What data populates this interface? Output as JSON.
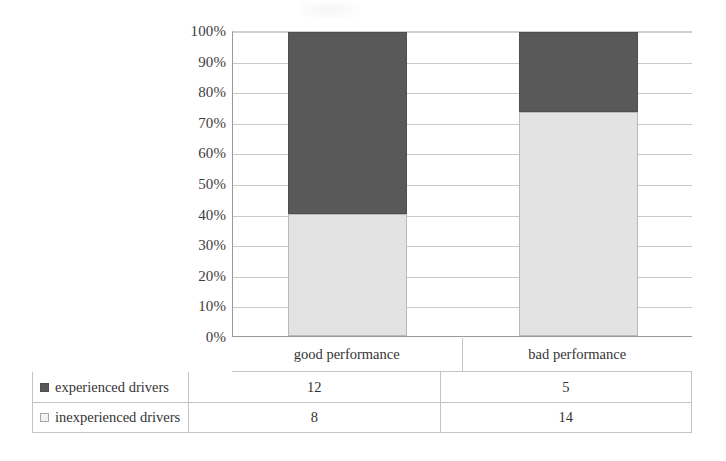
{
  "chart_data": {
    "type": "bar",
    "subtype": "stacked-100-percent",
    "title": "",
    "subtitle": "",
    "xlabel": "",
    "ylabel": "",
    "categories": [
      "good performance",
      "bad performance"
    ],
    "series": [
      {
        "name": "experienced drivers",
        "values": [
          12,
          5
        ],
        "percents": [
          60,
          26.3
        ],
        "color": "#595959",
        "marker": "filled-square"
      },
      {
        "name": "inexperienced drivers",
        "values": [
          8,
          14
        ],
        "percents": [
          40,
          73.7
        ],
        "color": "#e3e3e3",
        "marker": "outlined-square"
      }
    ],
    "stack_order": [
      "inexperienced drivers",
      "experienced drivers"
    ],
    "totals": [
      20,
      19
    ],
    "ylim": [
      0,
      100
    ],
    "y_ticks": [
      "0%",
      "10%",
      "20%",
      "30%",
      "40%",
      "50%",
      "60%",
      "70%",
      "80%",
      "90%",
      "100%"
    ],
    "y_tick_values": [
      0,
      10,
      20,
      30,
      40,
      50,
      60,
      70,
      80,
      90,
      100
    ],
    "y_axis_unit": "%",
    "grid": true,
    "grid_orientation": "horizontal",
    "legend_position": "data-table-left-column",
    "data_table_visible": true
  },
  "axis": {
    "y_ticks": [
      {
        "label": "100%",
        "value": 100
      },
      {
        "label": "90%",
        "value": 90
      },
      {
        "label": "80%",
        "value": 80
      },
      {
        "label": "70%",
        "value": 70
      },
      {
        "label": "60%",
        "value": 60
      },
      {
        "label": "50%",
        "value": 50
      },
      {
        "label": "40%",
        "value": 40
      },
      {
        "label": "30%",
        "value": 30
      },
      {
        "label": "20%",
        "value": 20
      },
      {
        "label": "10%",
        "value": 10
      },
      {
        "label": "0%",
        "value": 0
      }
    ]
  },
  "categories": [
    {
      "label": "good performance"
    },
    {
      "label": "bad performance"
    }
  ],
  "bars": [
    {
      "category": "good performance",
      "segments": [
        {
          "series": "experienced drivers",
          "value": 12,
          "percent": 60,
          "style": "dark"
        },
        {
          "series": "inexperienced drivers",
          "value": 8,
          "percent": 40,
          "style": "light"
        }
      ]
    },
    {
      "category": "bad performance",
      "segments": [
        {
          "series": "experienced drivers",
          "value": 5,
          "percent": 26.3,
          "style": "dark"
        },
        {
          "series": "inexperienced drivers",
          "value": 14,
          "percent": 73.7,
          "style": "light"
        }
      ]
    }
  ],
  "table": {
    "rows": [
      {
        "legend_label": "experienced drivers",
        "swatch": "dark",
        "values": [
          "12",
          "5"
        ]
      },
      {
        "legend_label": "inexperienced drivers",
        "swatch": "light",
        "values": [
          "8",
          "14"
        ]
      }
    ]
  },
  "colors": {
    "experienced": "#595959",
    "inexperienced": "#e3e3e3",
    "gridline": "#c9c9c9",
    "axis": "#9a9a9a",
    "table_border": "#c4c4c4",
    "text": "#343434"
  }
}
